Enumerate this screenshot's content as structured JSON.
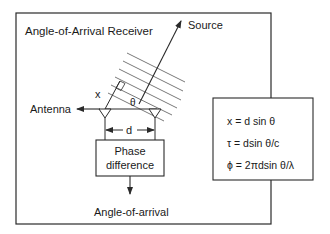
{
  "diagram": {
    "title": "Angle-of-Arrival Receiver",
    "labels": {
      "source": "Source",
      "antenna": "Antenna",
      "x": "x",
      "theta": "θ",
      "d": "d",
      "phase_line1": "Phase",
      "phase_line2": "difference",
      "output": "Angle-of-arrival"
    },
    "formulas": [
      "x = d sin θ",
      "τ = dsin θ/c",
      "ϕ = 2πdsin θ/λ"
    ],
    "wavefront_count": 6,
    "colors": {
      "line": "#2a2a2a",
      "background": "#ffffff"
    }
  }
}
